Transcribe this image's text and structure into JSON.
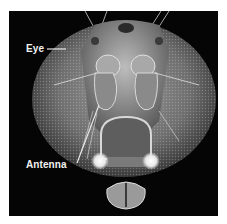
{
  "figure": {
    "background_color": "#050505",
    "labels": [
      {
        "text": "Eye"
      },
      {
        "text": "Antenna"
      }
    ]
  }
}
